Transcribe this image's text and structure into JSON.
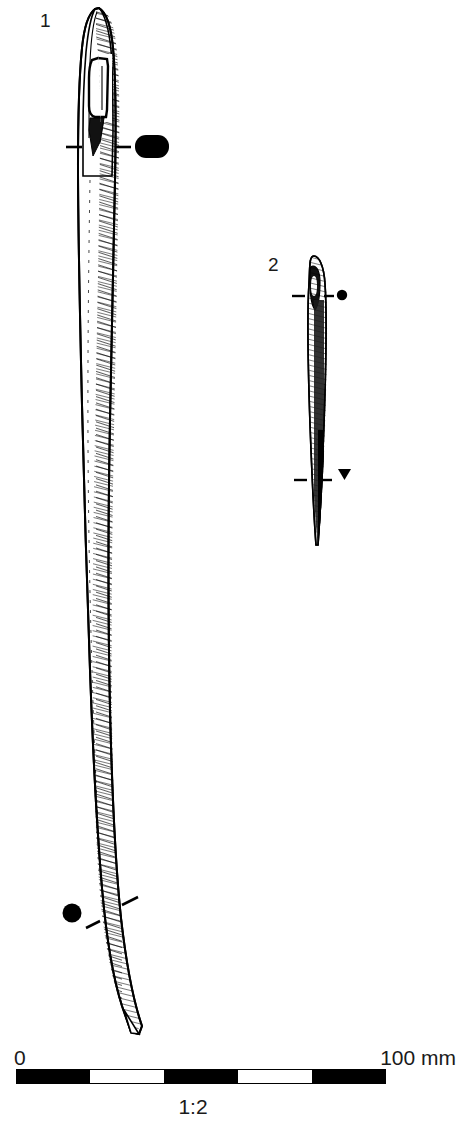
{
  "figure": {
    "type": "archaeological-line-drawing",
    "background_color": "#ffffff",
    "ink_color": "#000000"
  },
  "objects": [
    {
      "id": "1",
      "label": "1",
      "label_x": 40,
      "label_y": 11,
      "kind": "eyed-needle-large",
      "top_y": 8,
      "tip_y": 1035,
      "sections": [
        {
          "name": "upper-section",
          "shape": "rounded-rectangle-filled",
          "x": 152,
          "y": 147,
          "w": 34,
          "h": 22
        },
        {
          "name": "lower-section",
          "shape": "circle-filled",
          "x": 72,
          "y": 913,
          "r": 9
        }
      ]
    },
    {
      "id": "2",
      "label": "2",
      "label_x": 268,
      "label_y": 255,
      "kind": "eyed-needle-small",
      "top_y": 256,
      "tip_y": 546,
      "sections": [
        {
          "name": "upper-section",
          "shape": "circle-filled",
          "x": 341,
          "y": 296,
          "r": 5
        },
        {
          "name": "lower-section",
          "shape": "triangle-filled",
          "x": 344,
          "y": 474,
          "w": 13,
          "h": 11
        }
      ]
    }
  ],
  "scale": {
    "zero_label": "0",
    "max_label": "100 mm",
    "ratio_label": "1:2",
    "unit": "mm",
    "range_min": 0,
    "range_max": 100,
    "segments": 5,
    "segment_fills": [
      "#000000",
      "#ffffff",
      "#000000",
      "#ffffff",
      "#000000"
    ],
    "bar_left": 16,
    "bar_right": 386,
    "bar_top": 1070,
    "bar_height": 13
  }
}
